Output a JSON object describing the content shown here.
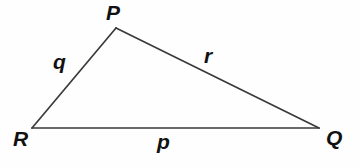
{
  "diagram": {
    "type": "triangle",
    "background_color": "#fefefe",
    "stroke_color": "#3a3a3a",
    "stroke_width": 1.6,
    "label_color": "#111111",
    "canvas": {
      "width": 360,
      "height": 167
    },
    "vertices": [
      {
        "id": "P",
        "label": "P",
        "x": 116,
        "y": 28
      },
      {
        "id": "Q",
        "label": "Q",
        "x": 319,
        "y": 128
      },
      {
        "id": "R",
        "label": "R",
        "x": 32,
        "y": 128
      }
    ],
    "sides": [
      {
        "id": "p",
        "label": "p",
        "from": "R",
        "to": "Q",
        "opposite_vertex": "P"
      },
      {
        "id": "q",
        "label": "q",
        "from": "R",
        "to": "P",
        "opposite_vertex": "Q"
      },
      {
        "id": "r",
        "label": "r",
        "from": "P",
        "to": "Q",
        "opposite_vertex": "R"
      }
    ],
    "vertex_labels": {
      "P": "P",
      "Q": "Q",
      "R": "R"
    },
    "side_labels": {
      "p": "p",
      "q": "q",
      "r": "r"
    }
  }
}
